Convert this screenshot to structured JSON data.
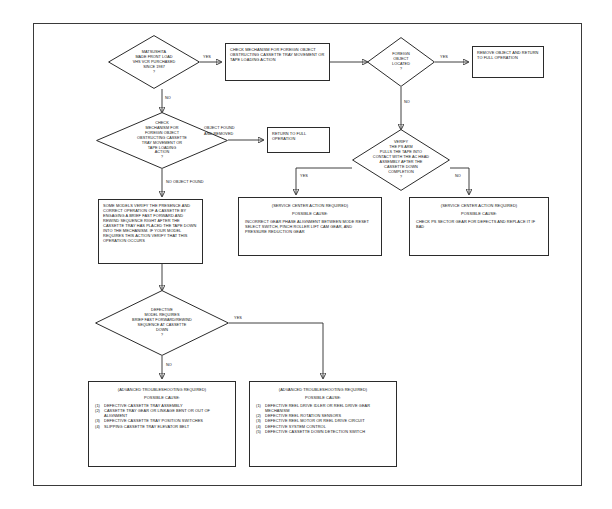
{
  "document": {
    "type": "troubleshooting-flowchart",
    "frame_border_color": "#3a3a3a"
  },
  "nodes": {
    "d1": {
      "kind": "decision",
      "lines": [
        "MATSUSHITA",
        "MADE FRONT LOAD",
        "VHS VCR PURCHASED",
        "SINCE 1987"
      ],
      "question_mark": "?"
    },
    "p1": {
      "kind": "process",
      "text": "CHECK MECHANISM FOR FOREIGN OBJECT OBSTRUCTING CASSETTE TRAY MOVEMENT OR TAPE LOADING ACTION"
    },
    "d2": {
      "kind": "decision",
      "lines": [
        "FOREIGN",
        "OBJECT",
        "LOCATED"
      ],
      "question_mark": "?"
    },
    "p2": {
      "kind": "process",
      "text": "REMOVE OBJECT AND RETURN TO FULL OPERATION"
    },
    "d3": {
      "kind": "decision",
      "lines": [
        "CHECK",
        "MECHANISM FOR",
        "FOREIGN OBJECT",
        "OBSTRUCTING CASSETTE",
        "TRAY MOVEMENT OR",
        "TAPE LOADING",
        "ACTION"
      ],
      "question_mark": "?"
    },
    "p3": {
      "kind": "process",
      "text": "RETURN TO FULL OPERATION"
    },
    "d4": {
      "kind": "decision",
      "lines": [
        "VERIFY",
        "THE PS ARM",
        "PULLS THE TAPE INTO",
        "CONTACT WITH THE AC HEAD",
        "ASSEMBLY AFTER THE",
        "CASSETTE DOWN",
        "COMPLETION"
      ],
      "question_mark": "?"
    },
    "p4": {
      "kind": "process",
      "text": "SOME MODELS VERIFY THE PRESENCE AND CORRECT OPERATION OF A CASSETTE BY ENGAGING A BRIEF FAST FORWARD AND REWIND SEQUENCE RIGHT AFTER THE CASSETTE TRAY HAS PLACED THE TAPE DOWN INTO THE MECHANISM. IF YOUR MODEL REQUIRES THIS ACTION VERIFY THAT THIS OPERATION OCCURS"
    },
    "p5": {
      "kind": "result",
      "header": "(SERVICE CENTER ACTION REQUIRED)",
      "cause_label": "POSSIBLE CAUSE:",
      "body": "INCORRECT GEAR PHASE ALIGNMENT BETWEEN MODE RESET SELECT SWITCH, PINCH ROLLER LIFT CAM GEAR, AND PRESSURE REDUCTION GEAR"
    },
    "p6": {
      "kind": "result",
      "header": "(SERVICE CENTER ACTION REQUIRED)",
      "cause_label": "POSSIBLE CAUSE:",
      "body": "CHECK PS SECTOR GEAR FOR DEFECTS AND REPLACE IT IF BAD"
    },
    "d5": {
      "kind": "decision",
      "lines": [
        "DEFECTIVE",
        "MODEL REQUIRES",
        "BRIEF FAST FORWARD/REWIND",
        "SEQUENCE AT CASSETTE",
        "DOWN"
      ],
      "question_mark": "?"
    },
    "p7": {
      "kind": "result",
      "header": "(ADVANCED TROUBLESHOOTING REQUIRED)",
      "cause_label": "POSSIBLE CAUSE:",
      "causes": [
        {
          "num": "(1)",
          "text": "DEFECTIVE CASSETTE TRAY ASSEMBLY"
        },
        {
          "num": "(2)",
          "text": "CASSETTE TRAY GEAR OR LINKAGE BENT OR OUT OF ALIGNMENT"
        },
        {
          "num": "(3)",
          "text": "DEFECTIVE CASSETTE TRAY POSITION SWITCHES"
        },
        {
          "num": "(4)",
          "text": "SLIPPING CASSETTE TRAY ELEVATOR BELT"
        }
      ]
    },
    "p8": {
      "kind": "result",
      "header": "(ADVANCED TROUBLESHOOTING REQUIRED)",
      "cause_label": "POSSIBLE CAUSE:",
      "causes": [
        {
          "num": "(1)",
          "text": "DEFECTIVE REEL DRIVE IDLER OR REEL DRIVE GEAR MECHANISM"
        },
        {
          "num": "(2)",
          "text": "DEFECTIVE REEL ROTATION SENSORS"
        },
        {
          "num": "(3)",
          "text": "DEFECTIVE REEL MOTOR OR REEL DRIVE CIRCUIT"
        },
        {
          "num": "(4)",
          "text": "DEFECTIVE SYSTEM CONTROL"
        },
        {
          "num": "(5)",
          "text": "DEFECTIVE CASSETTE DOWN DETECTION SWITCH"
        }
      ]
    }
  },
  "edge_labels": {
    "d1_yes": "YES",
    "d1_no": "NO",
    "d2_yes": "YES",
    "d2_no": "NO",
    "d3_found": "OBJECT FOUND AND REMOVED",
    "d3_found_l1": "OBJECT FOUND",
    "d3_found_l2": "AND REMOVED",
    "d3_none": "NO OBJECT FOUND",
    "d4_yes": "YES",
    "d4_no": "NO",
    "d5_yes": "YES",
    "d5_no": "NO"
  }
}
